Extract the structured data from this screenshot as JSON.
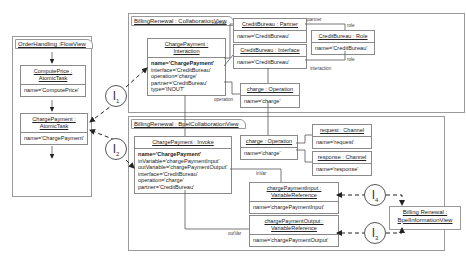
{
  "views": {
    "flow": "OrderHandling :FlowView",
    "collab": "BillingRenewal : CollaborationView",
    "bpel_collab": "BillingRenewal : BpelCollaborationView",
    "bpel_info": [
      "Billing Renewal :",
      "BpelInformationView"
    ]
  },
  "flow_boxes": {
    "compute": {
      "head": [
        "ComputePrice :",
        "AtomicTask"
      ],
      "attr": "name='ComputePrice'"
    },
    "charge": {
      "head": [
        "ChargePayment :",
        "AtomicTask"
      ],
      "attr": "name='ChargePayment'"
    }
  },
  "collab_boxes": {
    "interaction": {
      "head": [
        "ChargePayment :",
        "Interaction"
      ],
      "attrs": [
        "name='ChargePayment'",
        "interface='CreditBureau'",
        "operation='charge'",
        "partner='CreditBureau'",
        "type='INOUT'"
      ]
    },
    "partner": {
      "head": "CreditBureau : Partner",
      "attr": "name='CreditBureau'"
    },
    "interface": {
      "head": "CreditBureau : Interface",
      "attr": "name='CreditBureau'"
    },
    "role": {
      "head": "CreditBureau : Role",
      "attr": "name='CreditBureau'"
    },
    "operation": {
      "head": "charge : Operation",
      "attr": "name='charge'"
    }
  },
  "bpel_boxes": {
    "invoke": {
      "head": "ChargePayment : Invoke",
      "attrs": [
        "name='ChargePayment'",
        "inVariable='chargePaymentInput'",
        "outVariable='chargePaymentOutput'",
        "interface='CreditBureau'",
        "operation='charge'",
        "partner='CreditBureau'"
      ]
    },
    "operation": {
      "head": "charge : Operation",
      "attr": "name='charge'"
    },
    "request": {
      "head": "request : Channel",
      "attr": "name='request'"
    },
    "response": {
      "head": "response : Channel",
      "attr": "name='response'"
    },
    "input": {
      "head": [
        "chargePaymentInput :",
        "VariableReference"
      ],
      "attr": "name='chargePaymentInput'"
    },
    "output": {
      "head": [
        "chargePaymentOutput :",
        "VariableReference"
      ],
      "attr": "name='chargePaymentOutput'"
    }
  },
  "labels": {
    "partner": "partner",
    "role1": "role",
    "role2": "role",
    "partner2": "partner",
    "interaction": "interaction",
    "operation": "operation",
    "inVar": "inVar",
    "outVar": "outVar"
  },
  "links": [
    {
      "id": "I",
      "sub": "1"
    },
    {
      "id": "I",
      "sub": "2"
    },
    {
      "id": "I",
      "sub": "3"
    },
    {
      "id": "I",
      "sub": "4"
    }
  ]
}
